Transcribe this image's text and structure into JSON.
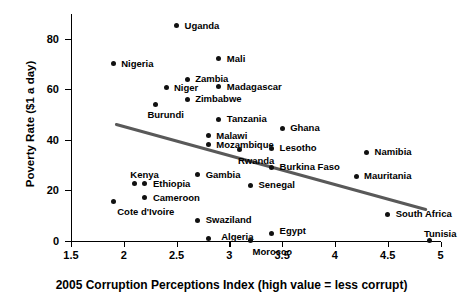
{
  "chart_data": {
    "type": "scatter",
    "title": "",
    "xlabel": "2005 Corruption Perceptions Index (high value = less corrupt)",
    "ylabel": "Poverty Rate ($1 a day)",
    "xlim": [
      1.5,
      5.0
    ],
    "ylim": [
      0,
      90
    ],
    "xticks": [
      "1.5",
      "2",
      "2.5",
      "3",
      "3.5",
      "4",
      "4.5",
      "5"
    ],
    "xtick_values": [
      1.5,
      2,
      2.5,
      3,
      3.5,
      4,
      4.5,
      5
    ],
    "yticks": [
      "0",
      "20",
      "40",
      "60",
      "80"
    ],
    "ytick_values": [
      0,
      20,
      40,
      60,
      80
    ],
    "grid": false,
    "legend": "none",
    "marker": "filled-circle",
    "marker_color": "#111111",
    "points": [
      {
        "label": "Uganda",
        "x": 2.5,
        "y": 85.0,
        "lx": 8,
        "ly": -5
      },
      {
        "label": "Mali",
        "x": 2.9,
        "y": 72.0,
        "lx": 8,
        "ly": -5
      },
      {
        "label": "Nigeria",
        "x": 1.9,
        "y": 70.0,
        "lx": 8,
        "ly": -5
      },
      {
        "label": "Zambia",
        "x": 2.6,
        "y": 64.0,
        "lx": 8,
        "ly": -5
      },
      {
        "label": "Niger",
        "x": 2.4,
        "y": 60.5,
        "lx": 8,
        "ly": -5
      },
      {
        "label": "Madagascar",
        "x": 2.9,
        "y": 61.0,
        "lx": 8,
        "ly": -5
      },
      {
        "label": "Zimbabwe",
        "x": 2.6,
        "y": 56.0,
        "lx": 8,
        "ly": -5
      },
      {
        "label": "Burundi",
        "x": 2.3,
        "y": 54.0,
        "lx": -8,
        "ly": 6
      },
      {
        "label": "Tanzania",
        "x": 2.9,
        "y": 48.0,
        "lx": 8,
        "ly": -5
      },
      {
        "label": "Ghana",
        "x": 3.5,
        "y": 44.5,
        "lx": 8,
        "ly": -5
      },
      {
        "label": "Malawi",
        "x": 2.8,
        "y": 41.5,
        "lx": 8,
        "ly": -5
      },
      {
        "label": "Mozambique",
        "x": 2.8,
        "y": 38.0,
        "lx": 8,
        "ly": -5
      },
      {
        "label": "Rwanda",
        "x": 3.1,
        "y": 36.0,
        "lx": -2,
        "ly": 6
      },
      {
        "label": "Lesotho",
        "x": 3.4,
        "y": 36.5,
        "lx": 8,
        "ly": -5
      },
      {
        "label": "Namibia",
        "x": 4.3,
        "y": 35.0,
        "lx": 8,
        "ly": -5
      },
      {
        "label": "Burkina Faso",
        "x": 3.4,
        "y": 29.0,
        "lx": 8,
        "ly": -5
      },
      {
        "label": "Gambia",
        "x": 2.7,
        "y": 26.0,
        "lx": 8,
        "ly": -5
      },
      {
        "label": "Mauritania",
        "x": 4.2,
        "y": 25.5,
        "lx": 8,
        "ly": -5
      },
      {
        "label": "Kenya",
        "x": 2.1,
        "y": 22.5,
        "lx": -4,
        "ly": -14
      },
      {
        "label": "Ethiopia",
        "x": 2.2,
        "y": 22.5,
        "lx": 8,
        "ly": -5
      },
      {
        "label": "Senegal",
        "x": 3.2,
        "y": 22.0,
        "lx": 8,
        "ly": -5
      },
      {
        "label": "Cameroon",
        "x": 2.2,
        "y": 17.0,
        "lx": 8,
        "ly": -5
      },
      {
        "label": "Cote d'Ivoire",
        "x": 1.9,
        "y": 15.5,
        "lx": 4,
        "ly": 6
      },
      {
        "label": "South Africa",
        "x": 4.5,
        "y": 10.5,
        "lx": 8,
        "ly": -5
      },
      {
        "label": "Swaziland",
        "x": 2.7,
        "y": 8.0,
        "lx": 8,
        "ly": -5
      },
      {
        "label": "Egypt",
        "x": 3.4,
        "y": 3.0,
        "lx": 8,
        "ly": -7
      },
      {
        "label": "Algeria",
        "x": 2.8,
        "y": 1.0,
        "lx": 13,
        "ly": -6
      },
      {
        "label": "Morocco",
        "x": 3.2,
        "y": 0.0,
        "lx": 2,
        "ly": 6
      },
      {
        "label": "Tunisia",
        "x": 4.9,
        "y": 0.0,
        "lx": -6,
        "ly": -12
      }
    ],
    "trendline": {
      "label": "linear-fit",
      "color": "#595959",
      "x_start": 1.93,
      "y_start": 46.0,
      "x_end": 4.86,
      "y_end": 12.3
    }
  }
}
